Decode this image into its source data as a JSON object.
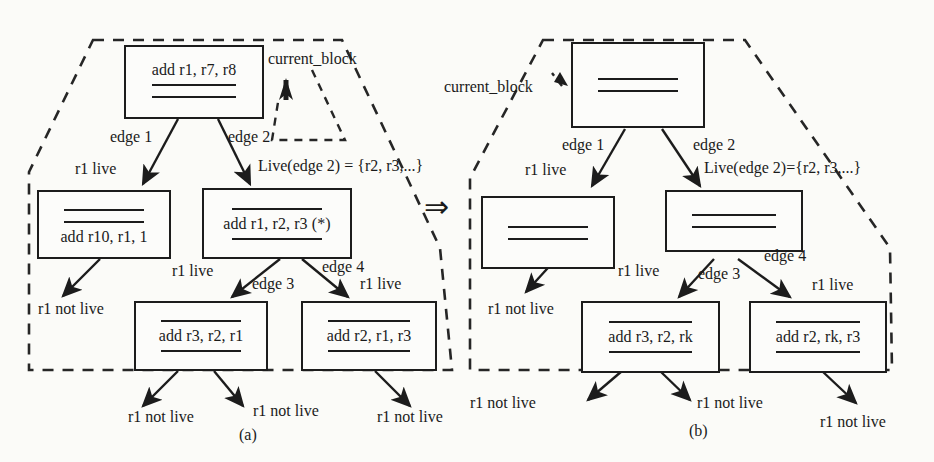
{
  "figure": {
    "caption_a": "(a)",
    "caption_b": "(b)",
    "transform_arrow": "⇒"
  },
  "panel_a": {
    "name": "before-renaming",
    "blocks": [
      {
        "id": "a-top",
        "code": "add r1, r7, r8",
        "code_position": "top",
        "rules": 2
      },
      {
        "id": "a-mid-left",
        "code": "add r10, r1, 1",
        "code_position": "bottom",
        "rules": 2
      },
      {
        "id": "a-mid-right",
        "code": "add r1, r2, r3 (*)",
        "code_position": "middle",
        "rules": 2
      },
      {
        "id": "a-bot-left",
        "code": "add r3, r2, r1",
        "code_position": "middle",
        "rules": 2
      },
      {
        "id": "a-bot-right",
        "code": "add r2, r1, r3",
        "code_position": "middle",
        "rules": 2
      }
    ],
    "callout": "current_block",
    "edge_labels": {
      "edge1": "edge 1",
      "edge2": "edge 2",
      "edge3": "edge 3",
      "edge4": "edge 4"
    },
    "live_set": "Live(edge 2) = {r2, r3,...}",
    "liveness": {
      "e1": "r1 live",
      "e2_left": "r1 live",
      "e3": "r1 live",
      "e4": "r1 live",
      "out_left": "r1 not live",
      "out_bl_1": "r1 not live",
      "out_bl_2": "r1 not live",
      "out_br": "r1 not live"
    }
  },
  "panel_b": {
    "name": "after-renaming",
    "blocks": [
      {
        "id": "b-top",
        "code": "",
        "code_position": "none",
        "rules": 2
      },
      {
        "id": "b-mid-left",
        "code": "",
        "code_position": "none",
        "rules": 2
      },
      {
        "id": "b-mid-right",
        "code": "",
        "code_position": "none",
        "rules": 2
      },
      {
        "id": "b-bot-left",
        "code": "add r3, r2, rk",
        "code_position": "middle",
        "rules": 2
      },
      {
        "id": "b-bot-right",
        "code": "add r2, rk, r3",
        "code_position": "middle",
        "rules": 2
      }
    ],
    "callout": "current_block",
    "edge_labels": {
      "edge1": "edge 1",
      "edge2": "edge 2",
      "edge3": "edge 3",
      "edge4": "edge 4"
    },
    "live_set": "Live(edge 2)={r2, r3,...}",
    "liveness": {
      "e1": "r1 live",
      "e3": "r1 live",
      "e4": "r1 live",
      "out_left": "r1 not live",
      "out_bl_1": "r1 not live",
      "out_bl_2": "r1 not live",
      "out_br": "r1 not live"
    }
  },
  "colors": {
    "ink": "#1c1c1c",
    "paper": "#fbfbf8",
    "dashed": "#262626"
  }
}
